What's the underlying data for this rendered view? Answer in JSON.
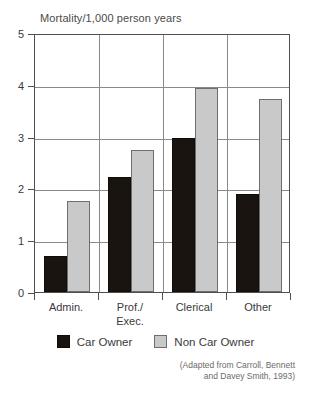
{
  "chart_data": {
    "type": "bar",
    "title": "Mortality/1,000 person years",
    "xlabel": "",
    "ylabel": "Mortality/1,000 person years",
    "ylim": [
      0,
      5
    ],
    "yticks": [
      0,
      1,
      2,
      3,
      4,
      5
    ],
    "grid": true,
    "legend_position": "bottom-center",
    "categories": [
      "Admin.",
      "Prof./\nExec.",
      "Clerical",
      "Other"
    ],
    "series": [
      {
        "name": "Car Owner",
        "color": "#1a1410",
        "values": [
          0.7,
          2.22,
          2.97,
          1.9
        ]
      },
      {
        "name": "Non Car Owner",
        "color": "#c9c9c9",
        "values": [
          1.75,
          2.75,
          3.93,
          3.72
        ]
      }
    ],
    "annotations": [
      "(Adapted from Carroll, Bennett",
      "and Davey Smith, 1993)"
    ]
  },
  "axis": {
    "tick_labels": [
      "0",
      "1",
      "2",
      "3",
      "4",
      "5"
    ]
  },
  "legend": {
    "items": [
      {
        "label": "Car Owner",
        "swatch": "black-square-swatch"
      },
      {
        "label": "Non Car Owner",
        "swatch": "gray-square-swatch"
      }
    ]
  },
  "source_note": {
    "line1": "(Adapted from Carroll, Bennett",
    "line2": "and Davey Smith, 1993)"
  },
  "colors": {
    "owner": "#1a1410",
    "nonowner": "#c9c9c9",
    "frame": "#4f4f4f",
    "grid": "#8a8a8a",
    "text": "#3a3a3a",
    "note": "#6b6b6b"
  }
}
